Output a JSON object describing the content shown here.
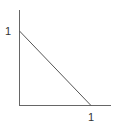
{
  "diagram": {
    "type": "line-on-axes",
    "y_axis_label": "1",
    "x_axis_label": "1",
    "line": {
      "from": [
        0,
        1
      ],
      "to": [
        1,
        0
      ]
    },
    "colors": {
      "axis": "#555555",
      "line": "#555555",
      "text": "#333333"
    }
  }
}
